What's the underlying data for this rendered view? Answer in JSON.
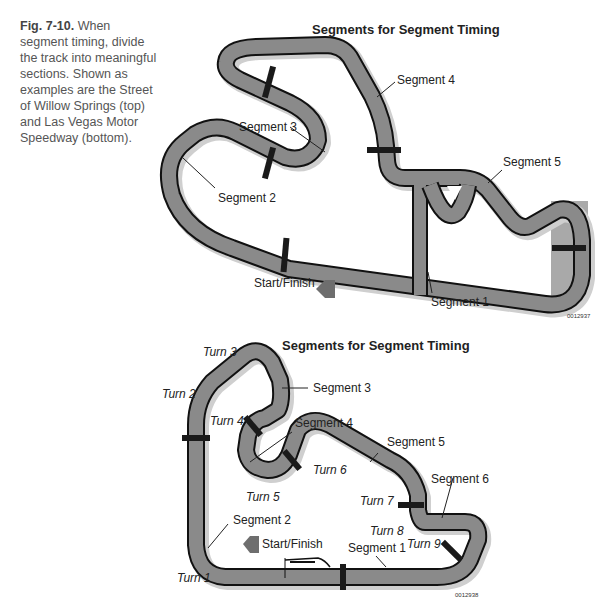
{
  "caption": {
    "figure_number": "Fig. 7-10.",
    "text": "When segment timing, divide the track into meaningful sections. Shown as examples are the Street of Willow Springs (top) and Las Vegas Motor Speedway (bottom)."
  },
  "top_diagram": {
    "title": "Segments for Segment Timing",
    "labels": {
      "segment1": "Segment 1",
      "segment2": "Segment 2",
      "segment3": "Segment 3",
      "segment4": "Segment 4",
      "segment5": "Segment 5",
      "start_finish": "Start/Finish"
    },
    "code": "0012937"
  },
  "bottom_diagram": {
    "title": "Segments for Segment Timing",
    "labels": {
      "segment1": "Segment 1",
      "segment2": "Segment 2",
      "segment3": "Segment 3",
      "segment4": "Segment 4",
      "segment5": "Segment 5",
      "segment6": "Segment 6",
      "start_finish": "Start/Finish"
    },
    "turns": {
      "turn1": "Turn 1",
      "turn2": "Turn 2",
      "turn3": "Turn 3",
      "turn4": "Turn 4",
      "turn5": "Turn 5",
      "turn6": "Turn 6",
      "turn7": "Turn 7",
      "turn8": "Turn 8",
      "turn9": "Turn 9"
    },
    "code": "0012938"
  },
  "colors": {
    "track": "#8a8a8a",
    "track_edge": "#111111",
    "shadow": "#cfcfcf",
    "marker": "#1a1a1a",
    "arrow": "#6e6e6e"
  }
}
